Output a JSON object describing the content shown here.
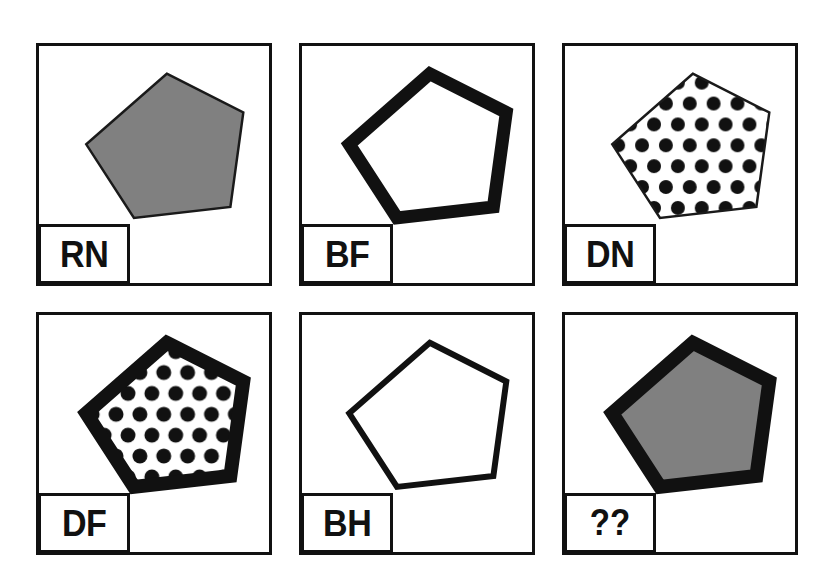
{
  "figure": {
    "rows": 2,
    "columns": 3,
    "background_color": "#ffffff",
    "border_color": "#111111",
    "fill_gray": "#808080",
    "dot_color": "#111111"
  },
  "panels": [
    {
      "id": "panel-rn",
      "label": "RN",
      "label_full": "RN",
      "fill": "gray",
      "outline": "thin",
      "row": 1,
      "column": 1
    },
    {
      "id": "panel-bf",
      "label": "BF",
      "label_full": "BF",
      "fill": "blank",
      "outline": "thick",
      "row": 1,
      "column": 2
    },
    {
      "id": "panel-dn",
      "label": "DN",
      "label_full": "DN",
      "fill": "dotted",
      "outline": "thin",
      "row": 1,
      "column": 3
    },
    {
      "id": "panel-df",
      "label": "DF",
      "label_full": "DF",
      "fill": "dotted",
      "outline": "thick",
      "row": 2,
      "column": 1
    },
    {
      "id": "panel-bh",
      "label": "BH",
      "label_full": "BH",
      "fill": "blank",
      "outline": "medium",
      "row": 2,
      "column": 2
    },
    {
      "id": "panel-query",
      "label": "??",
      "label_full": "??",
      "fill": "gray",
      "outline": "thick",
      "row": 2,
      "column": 3
    }
  ]
}
